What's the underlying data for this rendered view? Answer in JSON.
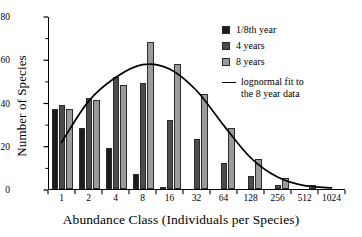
{
  "chart_data": {
    "type": "bar",
    "title": "",
    "subtitle": "",
    "xlabel": "Abundance Class (Individuals per Species)",
    "ylabel": "Number of Species",
    "categories": [
      "1",
      "2",
      "4",
      "8",
      "16",
      "32",
      "64",
      "128",
      "256",
      "512",
      "1024"
    ],
    "ylim": [
      0,
      80
    ],
    "yticks": [
      0,
      20,
      40,
      60,
      80
    ],
    "ytick_labels": [
      "0",
      "20",
      "40",
      "60",
      "80"
    ],
    "yminor_ticks": [
      10,
      30,
      50,
      70
    ],
    "grid": false,
    "legend_position": "top-right",
    "series": [
      {
        "name": "1/8th year",
        "color": "#1c1c1c",
        "values": [
          37,
          28,
          19,
          7,
          1,
          0,
          0,
          0,
          0,
          0,
          0
        ]
      },
      {
        "name": "4 years",
        "color": "#4c4c4c",
        "values": [
          39,
          42,
          52,
          49,
          32,
          23,
          12,
          6,
          2,
          0,
          0
        ]
      },
      {
        "name": "8 years",
        "color": "#9b9b9b",
        "values": [
          37,
          41,
          48,
          68,
          58,
          44,
          28,
          14,
          5,
          2,
          0
        ]
      }
    ],
    "overlay_line": {
      "name": "lognormal fit to\nthe 8 year data",
      "color": "#000000",
      "x": [
        1,
        2,
        4,
        8,
        16,
        32,
        64,
        128,
        256,
        512,
        1024
      ],
      "points": [
        {
          "cat_index": 0,
          "value": 22
        },
        {
          "cat_index": 1,
          "value": 41
        },
        {
          "cat_index": 2,
          "value": 52
        },
        {
          "cat_index": 3,
          "value": 58
        },
        {
          "cat_index": 4,
          "value": 56
        },
        {
          "cat_index": 5,
          "value": 46
        },
        {
          "cat_index": 6,
          "value": 30
        },
        {
          "cat_index": 7,
          "value": 15
        },
        {
          "cat_index": 8,
          "value": 6
        },
        {
          "cat_index": 9,
          "value": 2
        },
        {
          "cat_index": 10,
          "value": 1
        }
      ]
    }
  },
  "legend": {
    "entries": [
      {
        "label": "1/8th year",
        "type": "swatch",
        "color": "#1c1c1c"
      },
      {
        "label": "4 years",
        "type": "swatch",
        "color": "#4c4c4c"
      },
      {
        "label": "8 years",
        "type": "swatch",
        "color": "#9b9b9b"
      }
    ],
    "line_entry": {
      "label": "lognormal fit to\nthe 8 year data",
      "type": "line",
      "color": "#000000"
    }
  }
}
